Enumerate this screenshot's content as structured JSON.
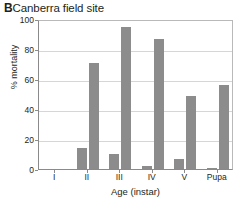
{
  "figure": {
    "panel_letter": "B",
    "title": "Canberra field site"
  },
  "chart_data": {
    "type": "bar",
    "xlabel": "Age (instar)",
    "ylabel": "% mortality",
    "categories": [
      "I",
      "II",
      "III",
      "IV",
      "V",
      "Pupa"
    ],
    "series": [
      {
        "name": "series-1",
        "values": [
          0,
          14,
          10,
          2,
          7,
          1
        ],
        "color": "#8c8c8c"
      },
      {
        "name": "series-2",
        "values": [
          0,
          71,
          95,
          87,
          49,
          56
        ],
        "color": "#8c8c8c"
      }
    ],
    "ylim": [
      0,
      100
    ],
    "yticks": [
      0,
      20,
      40,
      60,
      80,
      100
    ],
    "ytick_labels": [
      "0",
      "20",
      "40",
      "60",
      "80",
      "100"
    ],
    "grid": true,
    "grid_axis": "y",
    "legend": false,
    "bar_color": "#8c8c8c",
    "grid_color": "#d6d6d6",
    "axis_color": "#8a8a8a"
  }
}
